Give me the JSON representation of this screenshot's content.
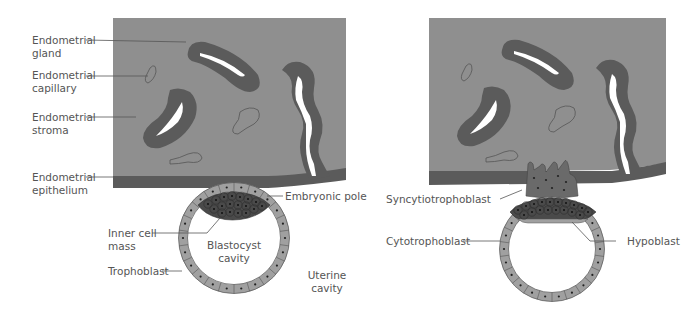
{
  "colors": {
    "stroma": "#8f8f8f",
    "gland": "#5b5b5b",
    "lumen": "#ffffff",
    "epithelium": "#5b5b5b",
    "trophoblast_cell": "#a0a0a0",
    "inner_cell_mass": "#4a4a4a",
    "syncytiotrophoblast": "#6a6a6a",
    "label_text": "#555555"
  },
  "left_panel": {
    "labels": {
      "endometrial_gland": [
        "Endometrial",
        "gland"
      ],
      "endometrial_capillary": [
        "Endometrial",
        "capillary"
      ],
      "endometrial_stroma": [
        "Endometrial",
        "stroma"
      ],
      "endometrial_epithelium": [
        "Endometrial",
        "epithelium"
      ],
      "embryonic_pole": "Embryonic pole",
      "inner_cell_mass": [
        "Inner cell",
        "mass"
      ],
      "blastocyst_cavity": [
        "Blastocyst",
        "cavity"
      ],
      "trophoblast": "Trophoblast",
      "uterine_cavity": [
        "Uterine",
        "cavity"
      ]
    }
  },
  "right_panel": {
    "labels": {
      "syncytiotrophoblast": "Syncytiotrophoblast",
      "cytotrophoblast": "Cytotrophoblast",
      "hypoblast": "Hypoblast"
    }
  }
}
